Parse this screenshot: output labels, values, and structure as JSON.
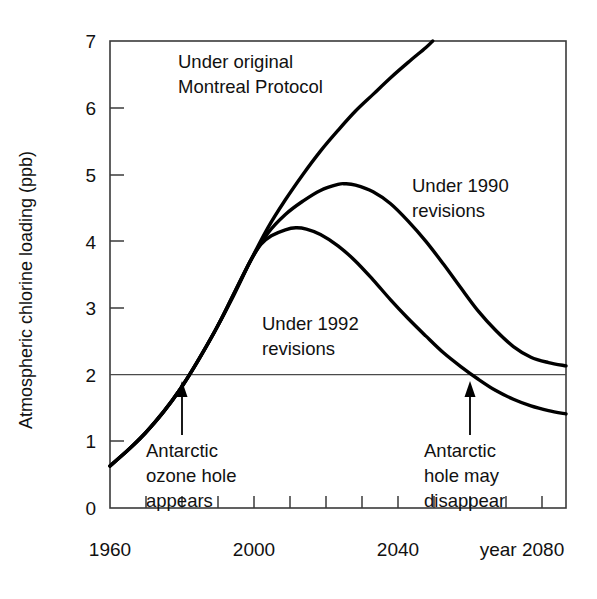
{
  "chart_data": {
    "type": "line",
    "title": "",
    "xlabel": "year",
    "ylabel": "Atmospheric chlorine loading (ppb)",
    "xlim": [
      1960,
      2090
    ],
    "ylim": [
      0,
      7
    ],
    "grid": false,
    "legend_position": "inline-labels",
    "x_tick_labels": [
      "1960",
      "2000",
      "2040",
      "year 2080"
    ],
    "x_tick_label_values": [
      1960,
      2000,
      2040,
      2080
    ],
    "x_minor_tick_step": 10,
    "y_tick_labels": [
      "0",
      "1",
      "2",
      "3",
      "4",
      "5",
      "6",
      "7"
    ],
    "y_tick_values": [
      0,
      1,
      2,
      3,
      4,
      5,
      6,
      7
    ],
    "reference_lines": [
      {
        "name": "two-ppb-threshold",
        "axis": "y",
        "value": 2,
        "label": ""
      }
    ],
    "series": [
      {
        "name": "Under original Montreal Protocol",
        "label": "Under original\nMontreal Protocol",
        "color": "#000000",
        "x": [
          1960,
          1965,
          1970,
          1975,
          1980,
          1985,
          1990,
          1995,
          2000,
          2005,
          2010,
          2015,
          2020,
          2025,
          2030,
          2035,
          2040,
          2045,
          2050,
          2052
        ],
        "y": [
          0.63,
          0.86,
          1.12,
          1.42,
          1.78,
          2.2,
          2.66,
          3.16,
          3.7,
          4.2,
          4.62,
          5.0,
          5.35,
          5.66,
          5.95,
          6.2,
          6.45,
          6.68,
          6.9,
          7.0
        ]
      },
      {
        "name": "Under 1990 revisions",
        "label": "Under 1990\nrevisions",
        "color": "#000000",
        "x": [
          1960,
          1970,
          1980,
          1990,
          2000,
          2005,
          2010,
          2015,
          2020,
          2025,
          2027,
          2030,
          2035,
          2040,
          2045,
          2050,
          2055,
          2060,
          2065,
          2070,
          2075,
          2080,
          2085,
          2090
        ],
        "y": [
          0.63,
          1.12,
          1.78,
          2.66,
          3.7,
          4.12,
          4.4,
          4.6,
          4.76,
          4.85,
          4.86,
          4.84,
          4.74,
          4.56,
          4.3,
          4.0,
          3.66,
          3.3,
          2.95,
          2.66,
          2.42,
          2.26,
          2.18,
          2.13
        ]
      },
      {
        "name": "Under 1992 revisions",
        "label": "Under 1992\nrevisions",
        "color": "#000000",
        "x": [
          1960,
          1970,
          1980,
          1990,
          1995,
          2000,
          2003,
          2006,
          2010,
          2013,
          2016,
          2020,
          2025,
          2030,
          2035,
          2040,
          2045,
          2050,
          2055,
          2060,
          2065,
          2070,
          2075,
          2080,
          2085,
          2090
        ],
        "y": [
          0.63,
          1.12,
          1.78,
          2.66,
          3.18,
          3.7,
          3.95,
          4.08,
          4.17,
          4.2,
          4.18,
          4.1,
          3.93,
          3.7,
          3.42,
          3.12,
          2.84,
          2.58,
          2.33,
          2.12,
          1.93,
          1.76,
          1.63,
          1.53,
          1.46,
          1.41
        ]
      }
    ],
    "annotations": [
      {
        "name": "antarctic-ozone-hole-appears",
        "text": "Antarctic\nozone hole\nappears",
        "lines": [
          "Antarctic",
          "ozone hole",
          "appears"
        ],
        "arrow_tip_x": 1980,
        "arrow_tip_y": 2,
        "arrow": "up"
      },
      {
        "name": "antarctic-hole-may-disappear",
        "text": "Antarctic\nhole may\ndisappear",
        "lines": [
          "Antarctic",
          "hole may",
          "disappear"
        ],
        "arrow_tip_x": 2068,
        "arrow_tip_y": 2,
        "arrow": "up"
      }
    ],
    "series_labels": [
      {
        "name": "label-original-montreal-protocol",
        "lines": [
          "Under original",
          "Montreal Protocol"
        ]
      },
      {
        "name": "label-1990-revisions",
        "lines": [
          "Under 1990",
          "revisions"
        ]
      },
      {
        "name": "label-1992-revisions",
        "lines": [
          "Under 1992",
          "revisions"
        ]
      }
    ]
  },
  "axes": {
    "y_title": "Atmospheric chlorine loading (ppb)",
    "y_ticks": [
      "7",
      "6",
      "5",
      "4",
      "3",
      "2",
      "1",
      "0"
    ],
    "x_ticks": [
      "1960",
      "2000",
      "2040",
      "year 2080"
    ]
  },
  "colors": {
    "line": "#000000",
    "frame": "#3a3a3a",
    "reference": "#4a4a4a",
    "background": "#ffffff"
  }
}
